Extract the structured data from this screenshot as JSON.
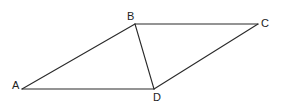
{
  "diagram": {
    "type": "geometry-parallelogram",
    "stroke_color": "#2a2a2a",
    "vertices": [
      {
        "id": "A",
        "label": "A",
        "x": 22,
        "y": 89,
        "label_x": 12,
        "label_y": 89
      },
      {
        "id": "B",
        "label": "B",
        "x": 135,
        "y": 24,
        "label_x": 127,
        "label_y": 20
      },
      {
        "id": "C",
        "label": "C",
        "x": 258,
        "y": 24,
        "label_x": 261,
        "label_y": 27
      },
      {
        "id": "D",
        "label": "D",
        "x": 154,
        "y": 89,
        "label_x": 153,
        "label_y": 101
      }
    ],
    "edges": [
      {
        "from": "A",
        "to": "B"
      },
      {
        "from": "B",
        "to": "C"
      },
      {
        "from": "C",
        "to": "D"
      },
      {
        "from": "D",
        "to": "A"
      },
      {
        "from": "B",
        "to": "D"
      }
    ]
  }
}
